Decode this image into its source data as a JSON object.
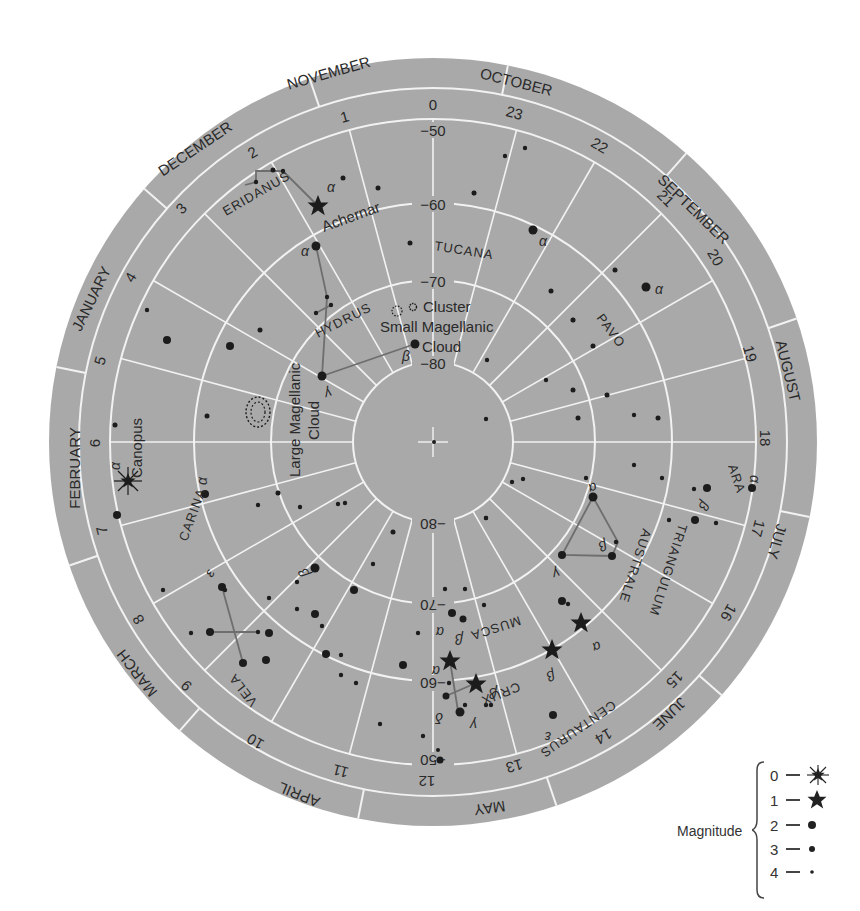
{
  "chart_data": {
    "type": "polar-star-chart",
    "center": "South Celestial Pole (-90)",
    "months": [
      "NOVEMBER",
      "OCTOBER",
      "SEPTEMBER",
      "AUGUST",
      "JULY",
      "JUNE",
      "MAY",
      "APRIL",
      "MARCH",
      "FEBRUARY",
      "JANUARY",
      "DECEMBER"
    ],
    "hours": [
      "0",
      "1",
      "2",
      "3",
      "4",
      "5",
      "6",
      "7",
      "8",
      "9",
      "10",
      "11",
      "12",
      "13",
      "14",
      "15",
      "16",
      "17",
      "18",
      "19",
      "20",
      "21",
      "22",
      "23"
    ],
    "declination_labels": [
      "-50",
      "-60",
      "-70",
      "-80"
    ],
    "constellations": [
      "ERIDANUS",
      "TUCANA",
      "HYDRUS",
      "PAVO",
      "ARA",
      "TRIANGULUM AUSTRALE",
      "CENTAURUS",
      "CRUX",
      "MUSCA",
      "CARINA",
      "VELA"
    ],
    "named_objects": [
      "Achernar",
      "Canopus",
      "Small Magellanic Cloud",
      "Cluster",
      "Large Magellanic Cloud"
    ],
    "legend": {
      "title": "Magnitude",
      "entries": [
        {
          "magnitude": "0",
          "symbol": "burst-star"
        },
        {
          "magnitude": "1",
          "symbol": "star"
        },
        {
          "magnitude": "2",
          "symbol": "large-dot"
        },
        {
          "magnitude": "3",
          "symbol": "medium-dot"
        },
        {
          "magnitude": "4",
          "symbol": "small-dot"
        }
      ]
    }
  },
  "colors": {
    "disc": "#a9a9a9",
    "grid": "#f2f2f2",
    "ink": "#1c1c1c",
    "line": "#6e6e6e"
  },
  "labels": {
    "months": {
      "nov": "NOVEMBER",
      "oct": "OCTOBER",
      "sep": "SEPTEMBER",
      "aug": "AUGUST",
      "jul": "JULY",
      "jun": "JUNE",
      "may": "MAY",
      "apr": "APRIL",
      "mar": "MARCH",
      "feb": "FEBRUARY",
      "jan": "JANUARY",
      "dec": "DECEMBER"
    },
    "hours": {
      "h0": "0",
      "h1": "1",
      "h2": "2",
      "h3": "3",
      "h4": "4",
      "h5": "5",
      "h6": "6",
      "h7": "7",
      "h8": "8",
      "h9": "9",
      "h10": "10",
      "h11": "11",
      "h12": "12",
      "h13": "13",
      "h14": "14",
      "h15": "15",
      "h16": "16",
      "h17": "17",
      "h18": "18",
      "h19": "19",
      "h20": "20",
      "h21": "21",
      "h22": "22",
      "h23": "23"
    },
    "dec": {
      "m50": "−50",
      "m60": "−60",
      "m70": "−70",
      "m80": "−80"
    },
    "constellations": {
      "eridanus": "ERIDANUS",
      "tucana": "TUCANA",
      "hydrus": "HYDRUS",
      "pavo": "PAVO",
      "ara": "ARA",
      "triangulum": "TRIANGULUM",
      "australe": "AUSTRALE",
      "centaurus": "CENTAURUS",
      "crux": "CRUX",
      "musca": "MUSCA",
      "carina": "CARINA",
      "vela": "VELA"
    },
    "objects": {
      "achernar": "Achernar",
      "canopus": "Canopus",
      "cluster": "Cluster",
      "smc1": "Small Magellanic",
      "smc2": "Cloud",
      "lmc1": "Large Magellanic",
      "lmc2": "Cloud"
    },
    "greek": {
      "alpha": "α",
      "beta": "β",
      "gamma": "γ",
      "delta": "δ",
      "epsilon": "ε"
    }
  },
  "legend": {
    "title": "Magnitude",
    "rows": [
      "0",
      "1",
      "2",
      "3",
      "4"
    ]
  }
}
